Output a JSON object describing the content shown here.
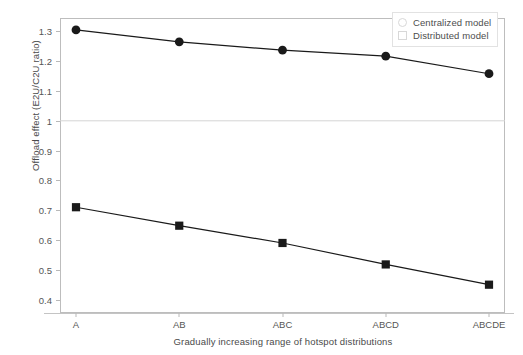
{
  "chart_data": {
    "type": "line",
    "title": "",
    "xlabel": "Gradually increasing range of hotspot distributions",
    "ylabel": "Offload effect (E2U/C2U ratio)",
    "categories": [
      "A",
      "AB",
      "ABC",
      "ABCD",
      "ABCDE"
    ],
    "ylim": [
      0.355,
      1.345
    ],
    "yticks": [
      0.4,
      0.5,
      0.6,
      0.7,
      0.8,
      0.9,
      1.0,
      1.1,
      1.2,
      1.3
    ],
    "ytick_labels": [
      "0.4",
      "0.5",
      "0.6",
      "0.7",
      "0.8",
      "0.9",
      "1",
      "1.1",
      "1.2",
      "1.3"
    ],
    "grid": false,
    "legend_position": "top-right",
    "reference_line": {
      "value": 1.0,
      "color": "#d4d4d4",
      "orientation": "horizontal"
    },
    "series": [
      {
        "name": "Centralized model",
        "marker": "circle",
        "color": "#1a1a1a",
        "values": [
          1.305,
          1.265,
          1.237,
          1.217,
          1.158
        ]
      },
      {
        "name": "Distributed model",
        "marker": "square",
        "color": "#1a1a1a",
        "values": [
          0.71,
          0.648,
          0.59,
          0.518,
          0.45
        ]
      }
    ]
  },
  "legend": {
    "items": [
      {
        "label": "Centralized model",
        "marker": "circle"
      },
      {
        "label": "Distributed model",
        "marker": "square"
      }
    ]
  },
  "colors": {
    "line": "#1a1a1a",
    "frame": "#bdbdbd",
    "reference_line": "#d4d4d4",
    "text": "#4a4a4a"
  }
}
